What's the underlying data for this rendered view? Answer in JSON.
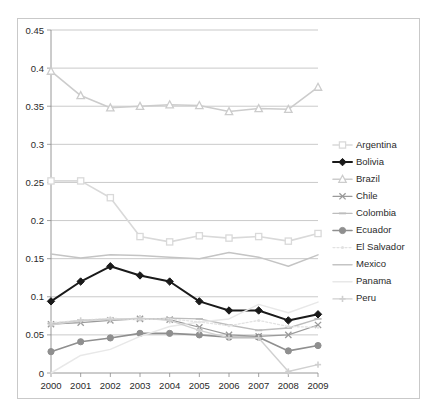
{
  "chart_data": {
    "type": "line",
    "title": "",
    "subtitle": "",
    "xlabel": "",
    "ylabel": "",
    "x": [
      2000,
      2001,
      2002,
      2003,
      2004,
      2005,
      2006,
      2007,
      2008,
      2009
    ],
    "categories": [
      "2000",
      "2001",
      "2002",
      "2003",
      "2004",
      "2005",
      "2006",
      "2007",
      "2008",
      "2009"
    ],
    "xlim": [
      2000,
      2009
    ],
    "ylim": [
      0,
      0.45
    ],
    "ytick_values": [
      0,
      0.05,
      0.1,
      0.15,
      0.2,
      0.25,
      0.3,
      0.35,
      0.4,
      0.45
    ],
    "ytick_labels": [
      "0",
      "0.05",
      "0.1",
      "0.15",
      "0.2",
      "0.25",
      "0.3",
      "0.35",
      "0.4",
      "0.45"
    ],
    "grid": true,
    "grid_axis": "y",
    "legend_position": "right",
    "plot_border": true,
    "series": [
      {
        "name": "Argentina",
        "color": "#d9d9d9",
        "marker": "square",
        "line_width": 1.6,
        "values": [
          0.252,
          0.252,
          0.23,
          0.179,
          0.172,
          0.18,
          0.177,
          0.179,
          0.173,
          0.183
        ]
      },
      {
        "name": "Bolivia",
        "color": "#1a1a1a",
        "marker": "diamond",
        "line_width": 2.0,
        "values": [
          0.094,
          0.12,
          0.14,
          0.128,
          0.12,
          0.094,
          0.082,
          0.082,
          0.069,
          0.077
        ]
      },
      {
        "name": "Brazil",
        "color": "#cccccc",
        "marker": "triangle",
        "line_width": 1.6,
        "values": [
          0.396,
          0.364,
          0.348,
          0.35,
          0.352,
          0.351,
          0.343,
          0.347,
          0.346,
          0.375
        ]
      },
      {
        "name": "Chile",
        "color": "#9a9a9a",
        "marker": "cross",
        "line_width": 1.2,
        "values": [
          0.064,
          0.066,
          0.069,
          0.071,
          0.07,
          0.06,
          0.05,
          0.048,
          0.05,
          0.063
        ]
      },
      {
        "name": "Colombia",
        "color": "#bdbdbd",
        "marker": "dash",
        "line_width": 1.4,
        "values": [
          0.065,
          0.069,
          0.071,
          0.07,
          0.072,
          0.071,
          0.063,
          0.056,
          0.059,
          0.071
        ]
      },
      {
        "name": "Ecuador",
        "color": "#8f8f8f",
        "marker": "circle",
        "line_width": 1.6,
        "values": [
          0.028,
          0.041,
          0.046,
          0.052,
          0.052,
          0.05,
          0.047,
          0.047,
          0.029,
          0.036
        ]
      },
      {
        "name": "El Salvador",
        "color": "#e2e2e2",
        "marker": "dotted",
        "line_width": 1.3,
        "values": [
          0.066,
          0.069,
          0.072,
          0.07,
          0.071,
          0.067,
          0.062,
          0.069,
          0.061,
          0.06
        ]
      },
      {
        "name": "Mexico",
        "color": "#c4c4c4",
        "marker": "none",
        "line_width": 1.5,
        "values": [
          0.156,
          0.151,
          0.155,
          0.154,
          0.152,
          0.15,
          0.158,
          0.152,
          0.14,
          0.155
        ]
      },
      {
        "name": "Panama",
        "color": "#e8e8e8",
        "marker": "none",
        "line_width": 1.5,
        "values": [
          0.0,
          0.023,
          0.031,
          0.048,
          0.061,
          0.067,
          0.071,
          0.09,
          0.079,
          0.093
        ]
      },
      {
        "name": "Peru",
        "color": "#d0d0d0",
        "marker": "dash-marker",
        "line_width": 1.4,
        "values": [
          0.063,
          0.069,
          0.07,
          0.072,
          0.069,
          0.056,
          0.046,
          0.046,
          0.002,
          0.011
        ]
      }
    ]
  },
  "legend": {
    "items": [
      {
        "label": "Argentina"
      },
      {
        "label": "Bolivia"
      },
      {
        "label": "Brazil"
      },
      {
        "label": "Chile"
      },
      {
        "label": "Colombia"
      },
      {
        "label": "Ecuador"
      },
      {
        "label": "El Salvador"
      },
      {
        "label": "Mexico"
      },
      {
        "label": "Panama"
      },
      {
        "label": "Peru"
      }
    ]
  }
}
